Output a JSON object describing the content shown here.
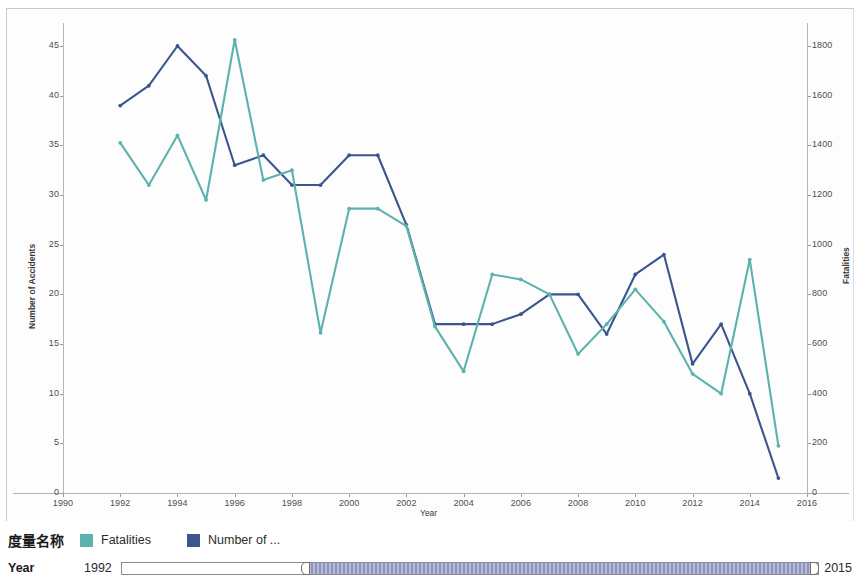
{
  "legend": {
    "title": "度量名称",
    "items": [
      {
        "label": "Fatalities",
        "color": "#5cb2ad",
        "swatch_name": "legend-swatch-fatalities"
      },
      {
        "label": "Number of ...",
        "color": "#3c558e",
        "swatch_name": "legend-swatch-accidents"
      }
    ]
  },
  "year_filter": {
    "label": "Year",
    "min_label": "1992",
    "max_label": "2015"
  },
  "chart_data": {
    "type": "line",
    "title": "",
    "xlabel": "Year",
    "ylabel": "Number of Accidents",
    "y2label": "Fatalities",
    "grid": false,
    "legend_position": "bottom",
    "xlim": [
      1990,
      2016
    ],
    "ylim": [
      0,
      45
    ],
    "y2lim": [
      0,
      1800
    ],
    "xticks": [
      1990,
      1992,
      1994,
      1996,
      1998,
      2000,
      2002,
      2004,
      2006,
      2008,
      2010,
      2012,
      2014,
      2016
    ],
    "yticks": [
      0,
      5,
      10,
      15,
      20,
      25,
      30,
      35,
      40,
      45
    ],
    "y2ticks": [
      0,
      200,
      400,
      600,
      800,
      1000,
      1200,
      1400,
      1600,
      1800
    ],
    "x": [
      1992,
      1993,
      1994,
      1995,
      1996,
      1997,
      1998,
      1999,
      2000,
      2001,
      2002,
      2003,
      2004,
      2005,
      2006,
      2007,
      2008,
      2009,
      2010,
      2011,
      2012,
      2013,
      2014,
      2015
    ],
    "series": [
      {
        "name": "Number of Accidents",
        "axis": "left",
        "color": "#3c558e",
        "values": [
          39,
          41,
          45,
          42,
          33,
          34,
          31,
          31,
          34,
          34,
          27,
          17,
          17,
          17,
          18,
          20,
          20,
          16,
          22,
          24,
          13,
          17,
          10,
          1.5
        ]
      },
      {
        "name": "Fatalities",
        "axis": "right",
        "color": "#5cb2ad",
        "values": [
          1410,
          1240,
          1440,
          1180,
          1825,
          1260,
          1300,
          645,
          1145,
          1145,
          1075,
          670,
          490,
          880,
          860,
          800,
          560,
          680,
          820,
          690,
          480,
          400,
          940,
          190
        ]
      }
    ]
  }
}
